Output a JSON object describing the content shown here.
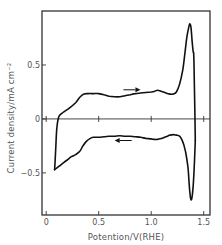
{
  "chart_data": {
    "type": "line",
    "title": "",
    "xlabel": "Potention/V(RHE)",
    "ylabel": "Current  density/mA cm⁻²",
    "xlim": [
      -0.04,
      1.56
    ],
    "ylim": [
      -0.89,
      1.0
    ],
    "grid": false,
    "legend": "none",
    "x_ticks": [
      {
        "value": 0,
        "label": "0"
      },
      {
        "value": 0.5,
        "label": "0.5"
      },
      {
        "value": 1.0,
        "label": "1.0"
      },
      {
        "value": 1.5,
        "label": "1.5"
      }
    ],
    "y_ticks": [
      {
        "value": 0.5,
        "label": "0.5"
      },
      {
        "value": 0,
        "label": "0"
      },
      {
        "value": -0.5,
        "label": "-0.5"
      }
    ],
    "series": [
      {
        "name": "anodic-sweep",
        "direction": "forward",
        "x": [
          0.08,
          0.09,
          0.1,
          0.12,
          0.16,
          0.22,
          0.28,
          0.32,
          0.36,
          0.4,
          0.45,
          0.5,
          0.55,
          0.6,
          0.65,
          0.7,
          0.75,
          0.8,
          0.85,
          0.9,
          0.95,
          1.0,
          1.03,
          1.06,
          1.1,
          1.14,
          1.18,
          1.21,
          1.24,
          1.27,
          1.3,
          1.32,
          1.34,
          1.36,
          1.37,
          1.38,
          1.39,
          1.4,
          1.405,
          1.41,
          1.415,
          1.42
        ],
        "y": [
          -0.47,
          -0.3,
          -0.1,
          0.02,
          0.06,
          0.1,
          0.15,
          0.2,
          0.23,
          0.235,
          0.235,
          0.235,
          0.225,
          0.21,
          0.205,
          0.205,
          0.215,
          0.225,
          0.235,
          0.24,
          0.245,
          0.25,
          0.255,
          0.265,
          0.255,
          0.24,
          0.23,
          0.23,
          0.25,
          0.32,
          0.45,
          0.6,
          0.76,
          0.86,
          0.88,
          0.84,
          0.72,
          0.62,
          0.6,
          0.4,
          0.1,
          -0.2
        ]
      },
      {
        "name": "cathodic-sweep",
        "direction": "reverse",
        "x": [
          1.42,
          1.41,
          1.4,
          1.39,
          1.38,
          1.37,
          1.36,
          1.35,
          1.33,
          1.31,
          1.29,
          1.27,
          1.24,
          1.21,
          1.18,
          1.14,
          1.1,
          1.06,
          1.03,
          1.0,
          0.95,
          0.9,
          0.85,
          0.8,
          0.75,
          0.7,
          0.65,
          0.6,
          0.55,
          0.5,
          0.45,
          0.42,
          0.38,
          0.35,
          0.32,
          0.28,
          0.24,
          0.2,
          0.16,
          0.12,
          0.08
        ],
        "y": [
          -0.2,
          -0.45,
          -0.62,
          -0.72,
          -0.75,
          -0.7,
          -0.58,
          -0.45,
          -0.32,
          -0.24,
          -0.19,
          -0.16,
          -0.15,
          -0.145,
          -0.15,
          -0.165,
          -0.18,
          -0.19,
          -0.19,
          -0.185,
          -0.18,
          -0.17,
          -0.165,
          -0.16,
          -0.16,
          -0.155,
          -0.16,
          -0.16,
          -0.165,
          -0.17,
          -0.17,
          -0.18,
          -0.21,
          -0.25,
          -0.3,
          -0.33,
          -0.35,
          -0.38,
          -0.41,
          -0.44,
          -0.47
        ]
      }
    ],
    "annotations": [
      {
        "type": "arrow",
        "direction": "right",
        "x": 0.85,
        "y": 0.27,
        "text": ""
      },
      {
        "type": "arrow",
        "direction": "left",
        "x": 0.7,
        "y": -0.2,
        "text": ""
      }
    ]
  }
}
